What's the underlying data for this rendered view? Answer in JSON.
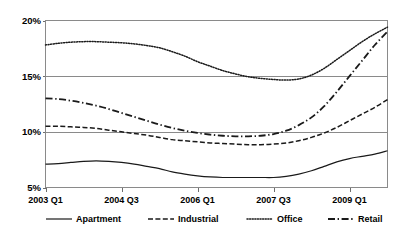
{
  "chart_data": {
    "type": "line",
    "title": "",
    "subtitle": "",
    "xlabel": "",
    "ylabel": "",
    "ylim": [
      5,
      20
    ],
    "y_ticks": [
      "5%",
      "10%",
      "15%",
      "20%"
    ],
    "y_tick_values": [
      5,
      10,
      15,
      20
    ],
    "grid": true,
    "legend_position": "bottom",
    "x_tick_labels": [
      "2003 Q1",
      "2004 Q3",
      "2006 Q1",
      "2007 Q3",
      "2009 Q1"
    ],
    "x_tick_values": [
      0,
      6,
      12,
      18,
      24
    ],
    "x": [
      0,
      1,
      2,
      3,
      4,
      5,
      6,
      7,
      8,
      9,
      10,
      11,
      12,
      13,
      14,
      15,
      16,
      17,
      18,
      19,
      20,
      21,
      22,
      23,
      24,
      25,
      26,
      27
    ],
    "x_labels": [
      "2003 Q1",
      "2003 Q2",
      "2003 Q3",
      "2003 Q4",
      "2004 Q1",
      "2004 Q2",
      "2004 Q3",
      "2004 Q4",
      "2005 Q1",
      "2005 Q2",
      "2005 Q3",
      "2005 Q4",
      "2006 Q1",
      "2006 Q2",
      "2006 Q3",
      "2006 Q4",
      "2007 Q1",
      "2007 Q2",
      "2007 Q3",
      "2007 Q4",
      "2008 Q1",
      "2008 Q2",
      "2008 Q3",
      "2008 Q4",
      "2009 Q1",
      "2009 Q2",
      "2009 Q3",
      "2009 Q4"
    ],
    "series": [
      {
        "name": "Apartment",
        "style": "solid",
        "values": [
          7.1,
          7.15,
          7.25,
          7.35,
          7.4,
          7.35,
          7.25,
          7.1,
          6.9,
          6.7,
          6.4,
          6.2,
          6.05,
          5.95,
          5.9,
          5.9,
          5.9,
          5.9,
          5.9,
          6.0,
          6.2,
          6.5,
          6.9,
          7.3,
          7.6,
          7.8,
          8.0,
          8.3
        ]
      },
      {
        "name": "Industrial",
        "style": "dashed",
        "values": [
          10.5,
          10.5,
          10.45,
          10.4,
          10.3,
          10.15,
          10.0,
          9.85,
          9.7,
          9.5,
          9.3,
          9.2,
          9.1,
          9.0,
          8.95,
          8.9,
          8.85,
          8.85,
          8.9,
          9.0,
          9.2,
          9.5,
          9.9,
          10.4,
          11.0,
          11.6,
          12.2,
          12.9
        ]
      },
      {
        "name": "Office",
        "style": "dotted",
        "values": [
          17.8,
          17.95,
          18.05,
          18.1,
          18.1,
          18.05,
          18.0,
          17.9,
          17.75,
          17.55,
          17.2,
          16.8,
          16.3,
          15.9,
          15.5,
          15.2,
          14.95,
          14.8,
          14.7,
          14.65,
          14.75,
          15.1,
          15.7,
          16.5,
          17.3,
          18.1,
          18.8,
          19.4
        ]
      },
      {
        "name": "Retail",
        "style": "dash-dot",
        "values": [
          13.0,
          12.95,
          12.8,
          12.6,
          12.35,
          12.05,
          11.7,
          11.35,
          11.0,
          10.65,
          10.35,
          10.1,
          9.9,
          9.75,
          9.65,
          9.6,
          9.6,
          9.65,
          9.8,
          10.1,
          10.6,
          11.3,
          12.3,
          13.6,
          15.0,
          16.4,
          17.8,
          19.0
        ]
      }
    ]
  },
  "legend": {
    "items": [
      {
        "label": "Apartment",
        "style": "solid"
      },
      {
        "label": "Industrial",
        "style": "dashed"
      },
      {
        "label": "Office",
        "style": "dotted"
      },
      {
        "label": "Retail",
        "style": "dash-dot"
      }
    ]
  },
  "colors": {
    "line": "#1a1a1a",
    "axis": "#8a8a8a",
    "background": "#ffffff",
    "text": "#000000"
  }
}
